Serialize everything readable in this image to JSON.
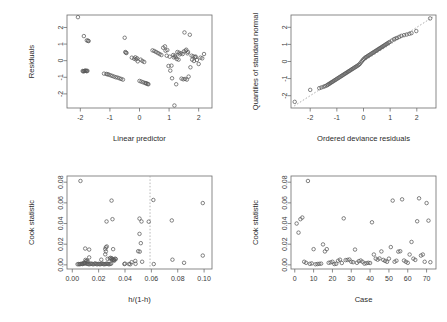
{
  "figure": {
    "title": "",
    "layout": "2x2 grid of GLM diagnostic plots",
    "background": "#ffffff",
    "point_color": "#5a5a5a",
    "axis_color": "#6d6d6d",
    "reference_line_color": "#9a9a9a"
  },
  "chart_data": [
    {
      "type": "scatter",
      "panel": "top-left",
      "title": "",
      "xlabel": "Linear predictor",
      "ylabel": "Residuals",
      "xlim": [
        -2.45,
        2.45
      ],
      "ylim": [
        -2.85,
        2.75
      ],
      "xticks": [
        -2,
        -1,
        0,
        1,
        2
      ],
      "yticks": [
        -2,
        -1,
        0,
        1,
        2
      ],
      "xtick_labels": [
        "-2",
        "-1",
        "0",
        "1",
        "2"
      ],
      "ytick_labels": [
        "-2",
        "-1",
        "0",
        "1",
        "2"
      ],
      "grid": false,
      "legend": "none",
      "x": [
        -2.08,
        -1.88,
        -1.78,
        -1.74,
        -1.72,
        -1.92,
        -1.9,
        -1.88,
        -1.86,
        -1.84,
        -1.82,
        -1.8,
        -1.78,
        -1.76,
        -1.2,
        -1.12,
        -1.08,
        -1.04,
        -0.98,
        -0.92,
        -0.86,
        -0.8,
        -0.74,
        -0.68,
        -0.62,
        -0.56,
        -0.5,
        -0.46,
        -0.26,
        -0.18,
        -0.12,
        -0.06,
        0.0,
        0.06,
        0.12,
        0.18,
        0.24,
        0.28,
        0.3,
        0.22,
        -0.48,
        -0.44,
        -0.14,
        -0.08,
        0.04,
        0.1,
        0.16,
        0.44,
        0.5,
        0.56,
        0.62,
        0.68,
        0.74,
        0.8,
        0.86,
        0.92,
        0.98,
        1.04,
        1.1,
        1.16,
        1.22,
        1.28,
        1.34,
        1.4,
        1.46,
        1.52,
        1.58,
        1.64,
        1.7,
        1.76,
        1.82,
        1.88,
        1.94,
        2.0,
        2.06,
        2.12,
        2.18,
        1.18,
        1.24,
        1.42,
        1.48,
        1.54,
        1.6,
        1.66,
        1.72,
        1.78,
        1.84,
        1.9,
        1.26,
        1.32,
        1.08,
        1.14,
        1.36,
        0.88,
        0.94,
        1.02,
        1.5,
        1.56,
        1.62,
        1.2
      ],
      "y": [
        2.62,
        1.48,
        1.22,
        1.2,
        1.18,
        -0.62,
        -0.64,
        -0.63,
        -0.62,
        -0.61,
        -0.6,
        -0.62,
        -0.63,
        -0.61,
        -0.78,
        -0.8,
        -0.82,
        -0.84,
        -0.88,
        -0.92,
        -0.96,
        -1.0,
        -1.02,
        -1.06,
        -1.1,
        -1.14,
        1.38,
        0.48,
        0.18,
        0.12,
        0.08,
        -0.04,
        -1.22,
        -1.26,
        -1.3,
        -1.34,
        -1.38,
        -1.4,
        -1.42,
        -1.36,
        0.52,
        0.46,
        0.2,
        0.14,
        0.06,
        -0.02,
        -0.08,
        0.62,
        0.58,
        0.52,
        0.46,
        0.4,
        0.34,
        0.78,
        0.86,
        0.3,
        -0.32,
        -0.6,
        -1.06,
        0.2,
        0.22,
        0.52,
        0.48,
        0.44,
        0.4,
        1.7,
        0.66,
        0.52,
        1.56,
        0.3,
        0.26,
        0.22,
        0.04,
        -0.2,
        0.18,
        0.14,
        0.4,
        -2.7,
        -1.42,
        -1.08,
        -1.12,
        -1.1,
        -1.14,
        -0.96,
        -0.4,
        0.06,
        -0.02,
        0.24,
        0.1,
        0.06,
        -0.3,
        0.34,
        0.38,
        0.6,
        0.64,
        0.24,
        0.56,
        0.6,
        0.44,
        0.3
      ]
    },
    {
      "type": "scatter",
      "panel": "top-right",
      "title": "",
      "xlabel": "Ordered deviance residuals",
      "ylabel": "Quantiles of standard normal",
      "xlim": [
        -2.72,
        2.72
      ],
      "ylim": [
        -2.72,
        2.72
      ],
      "xticks": [
        -2,
        -1,
        0,
        1,
        2
      ],
      "yticks": [
        -2,
        -1,
        0,
        1,
        2
      ],
      "xtick_labels": [
        "-2",
        "-1",
        "0",
        "1",
        "2"
      ],
      "ytick_labels": [
        "-2",
        "-1",
        "0",
        "1",
        "2"
      ],
      "grid": false,
      "legend": "none",
      "reference_line": {
        "type": "qq-line",
        "style": "dotted",
        "from": [
          -2.6,
          -2.6
        ],
        "to": [
          2.6,
          2.6
        ]
      },
      "x": [
        -2.58,
        -2.0,
        -1.66,
        -1.58,
        -1.5,
        -1.44,
        -1.38,
        -1.34,
        -1.3,
        -1.26,
        -1.22,
        -1.18,
        -1.14,
        -1.1,
        -1.06,
        -1.02,
        -0.98,
        -0.94,
        -0.9,
        -0.86,
        -0.82,
        -0.78,
        -0.74,
        -0.7,
        -0.66,
        -0.62,
        -0.58,
        -0.54,
        -0.5,
        -0.46,
        -0.42,
        -0.38,
        -0.34,
        -0.3,
        -0.26,
        -0.22,
        -0.18,
        -0.14,
        -0.1,
        -0.06,
        -0.02,
        0.02,
        0.06,
        0.1,
        0.14,
        0.18,
        0.22,
        0.26,
        0.3,
        0.34,
        0.38,
        0.42,
        0.46,
        0.5,
        0.54,
        0.58,
        0.62,
        0.66,
        0.7,
        0.74,
        0.78,
        0.82,
        0.86,
        0.9,
        0.94,
        0.98,
        1.06,
        1.14,
        1.2,
        1.26,
        1.34,
        1.42,
        1.52,
        1.62,
        1.72,
        1.8,
        1.98,
        2.5
      ],
      "y": [
        -2.36,
        -1.66,
        -1.56,
        -1.52,
        -1.48,
        -1.44,
        -1.4,
        -1.36,
        -1.32,
        -1.28,
        -1.24,
        -1.2,
        -1.16,
        -1.12,
        -1.08,
        -1.04,
        -1.0,
        -0.96,
        -0.92,
        -0.88,
        -0.84,
        -0.8,
        -0.76,
        -0.72,
        -0.68,
        -0.64,
        -0.6,
        -0.56,
        -0.52,
        -0.48,
        -0.44,
        -0.4,
        -0.36,
        -0.32,
        -0.28,
        -0.24,
        -0.2,
        -0.14,
        -0.06,
        0.02,
        0.1,
        0.16,
        0.22,
        0.26,
        0.3,
        0.34,
        0.38,
        0.42,
        0.46,
        0.5,
        0.54,
        0.58,
        0.62,
        0.66,
        0.7,
        0.74,
        0.78,
        0.82,
        0.86,
        0.9,
        0.94,
        0.98,
        1.02,
        1.06,
        1.1,
        1.14,
        1.22,
        1.3,
        1.34,
        1.38,
        1.44,
        1.5,
        1.54,
        1.58,
        1.62,
        1.66,
        1.78,
        2.52
      ]
    },
    {
      "type": "scatter",
      "panel": "bottom-left",
      "title": "",
      "xlabel": "h/(1-h)",
      "ylabel": "Cook statistic",
      "xlim": [
        -0.004,
        0.106
      ],
      "ylim": [
        -0.004,
        0.086
      ],
      "xticks": [
        0.0,
        0.02,
        0.04,
        0.06,
        0.08,
        0.1
      ],
      "yticks": [
        0.0,
        0.02,
        0.04,
        0.06,
        0.08
      ],
      "xtick_labels": [
        "0.00",
        "0.02",
        "0.04",
        "0.06",
        "0.08",
        "0.10"
      ],
      "ytick_labels": [
        "0.00",
        "0.02",
        "0.04",
        "0.06",
        "0.08"
      ],
      "grid": false,
      "legend": "none",
      "vertical_reference_line": {
        "x": 0.059,
        "style": "dotted"
      },
      "x": [
        0.0062,
        0.0098,
        0.026,
        0.0305,
        0.025,
        0.0255,
        0.051,
        0.052,
        0.0615,
        0.099,
        0.01,
        0.0255,
        0.0298,
        0.051,
        0.0525,
        0.058,
        0.0755,
        0.0128,
        0.025,
        0.0262,
        0.031,
        0.03,
        0.0318,
        0.05,
        0.0512,
        0.04,
        0.0128,
        0.022,
        0.0268,
        0.03,
        0.0315,
        0.043,
        0.045,
        0.0478,
        0.053,
        0.099,
        0.004,
        0.006,
        0.0075,
        0.0085,
        0.0092,
        0.01,
        0.0108,
        0.0115,
        0.0122,
        0.013,
        0.0138,
        0.0145,
        0.0152,
        0.016,
        0.0168,
        0.0175,
        0.0182,
        0.019,
        0.0198,
        0.0205,
        0.0212,
        0.022,
        0.0228,
        0.0235,
        0.0242,
        0.025,
        0.0258,
        0.0265,
        0.0272,
        0.028,
        0.0288,
        0.0295,
        0.0302,
        0.031,
        0.0318,
        0.0048,
        0.0055,
        0.0068,
        0.0078,
        0.0088,
        0.0095,
        0.0105,
        0.0112,
        0.0118,
        0.0395,
        0.044,
        0.048,
        0.0618,
        0.076,
        0.0848,
        0.0325,
        0.033,
        0.0285,
        0.029
      ],
      "y": [
        0.0812,
        0.0158,
        0.042,
        0.0442,
        0.0152,
        0.017,
        0.03,
        0.021,
        0.0628,
        0.0598,
        0.0048,
        0.013,
        0.0622,
        0.0448,
        0.042,
        0.0418,
        0.043,
        0.0148,
        0.0102,
        0.0178,
        0.0152,
        0.006,
        0.0048,
        0.0132,
        0.0128,
        0.0012,
        0.0072,
        0.005,
        0.0058,
        0.0062,
        0.005,
        0.0008,
        0.0026,
        0.0038,
        0.003,
        0.009,
        0.0006,
        0.0008,
        0.001,
        0.0012,
        0.0014,
        0.0016,
        0.0012,
        0.001,
        0.0008,
        0.0006,
        0.001,
        0.0012,
        0.0008,
        0.0006,
        0.001,
        0.0014,
        0.0008,
        0.0006,
        0.001,
        0.0008,
        0.0006,
        0.001,
        0.0012,
        0.0008,
        0.0006,
        0.0008,
        0.001,
        0.0012,
        0.0008,
        0.0006,
        0.001,
        0.0012,
        0.0048,
        0.0052,
        0.004,
        0.0008,
        0.0006,
        0.001,
        0.0008,
        0.002,
        0.0018,
        0.0036,
        0.0042,
        0.003,
        0.0008,
        0.0006,
        0.001,
        0.0008,
        0.005,
        0.002,
        0.006,
        0.0056,
        0.0062,
        0.0068
      ]
    },
    {
      "type": "scatter",
      "panel": "bottom-right",
      "title": "",
      "xlabel": "Case",
      "ylabel": "Cook statistic",
      "xlim": [
        -2,
        75
      ],
      "ylim": [
        -0.004,
        0.086
      ],
      "xticks": [
        0,
        10,
        20,
        30,
        40,
        50,
        60,
        70
      ],
      "yticks": [
        0.0,
        0.02,
        0.04,
        0.06,
        0.08
      ],
      "xtick_labels": [
        "0",
        "10",
        "20",
        "30",
        "40",
        "50",
        "60",
        "70"
      ],
      "ytick_labels": [
        "0.00",
        "0.02",
        "0.04",
        "0.06",
        "0.08"
      ],
      "grid": false,
      "legend": "none",
      "x": [
        1,
        2,
        3,
        4,
        5,
        6,
        7,
        8,
        9,
        10,
        11,
        12,
        13,
        14,
        15,
        16,
        17,
        18,
        19,
        20,
        21,
        22,
        23,
        24,
        25,
        26,
        27,
        28,
        29,
        30,
        31,
        32,
        33,
        34,
        35,
        36,
        37,
        38,
        39,
        40,
        41,
        42,
        43,
        44,
        45,
        46,
        47,
        48,
        49,
        50,
        51,
        52,
        53,
        54,
        55,
        56,
        57,
        58,
        59,
        60,
        61,
        62,
        63,
        64,
        65,
        66,
        67,
        68,
        69,
        70,
        71,
        72
      ],
      "y": [
        0.04,
        0.0312,
        0.0442,
        0.0458,
        0.003,
        0.002,
        0.0812,
        0.001,
        0.0014,
        0.0152,
        0.0006,
        0.0008,
        0.001,
        0.0012,
        0.0198,
        0.013,
        0.0152,
        0.002,
        0.0024,
        0.003,
        0.0008,
        0.001,
        0.004,
        0.005,
        0.0018,
        0.045,
        0.0046,
        0.0048,
        0.0052,
        0.003,
        0.0026,
        0.0148,
        0.002,
        0.0036,
        0.0042,
        0.003,
        0.0012,
        0.0016,
        0.002,
        0.0018,
        0.0412,
        0.01,
        0.006,
        0.005,
        0.0062,
        0.013,
        0.0048,
        0.0038,
        0.003,
        0.006,
        0.0172,
        0.0622,
        0.003,
        0.004,
        0.0128,
        0.0132,
        0.0634,
        0.0042,
        0.003,
        0.002,
        0.01,
        0.0222,
        0.006,
        0.0048,
        0.0422,
        0.0644,
        0.009,
        0.01,
        0.003,
        0.0598,
        0.0428,
        0.0026
      ]
    }
  ]
}
